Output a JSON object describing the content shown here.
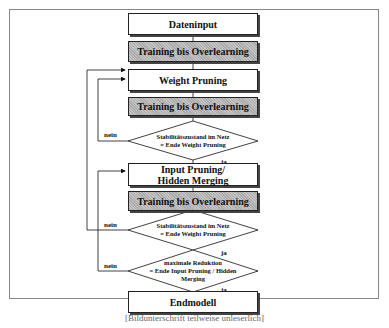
{
  "diagram": {
    "type": "flowchart",
    "language": "de",
    "nodes": [
      {
        "id": "dateninput",
        "label": "Dateninput",
        "shape": "rect",
        "shaded": false
      },
      {
        "id": "training1",
        "label": "Training bis Overlearning",
        "shape": "rect",
        "shaded": true
      },
      {
        "id": "weight_pruning",
        "label": "Weight Pruning",
        "shape": "rect",
        "shaded": false
      },
      {
        "id": "training2",
        "label": "Training bis Overlearning",
        "shape": "rect",
        "shaded": true
      },
      {
        "id": "decision1",
        "label_line1": "Stabilitätszustand im Netz",
        "label_line2": "= Ende Weight Pruning",
        "shape": "diamond"
      },
      {
        "id": "input_pruning",
        "label_line1": "Input Pruning/",
        "label_line2": "Hidden Merging",
        "shape": "rect",
        "shaded": false
      },
      {
        "id": "training3",
        "label": "Training bis Overlearning",
        "shape": "rect",
        "shaded": true
      },
      {
        "id": "decision2",
        "label_line1": "Stabilitätszustand im Netz",
        "label_line2": "= Ende Weight Pruning",
        "shape": "diamond"
      },
      {
        "id": "decision3",
        "label_line1": "maximale Reduktion",
        "label_line2": "= Ende Input Pruning / Hidden",
        "label_line3": "Merging",
        "shape": "diamond"
      },
      {
        "id": "endmodell",
        "label": "Endmodell",
        "shape": "rect",
        "shaded": false
      }
    ],
    "edges": [
      {
        "from": "dateninput",
        "to": "training1"
      },
      {
        "from": "training1",
        "to": "weight_pruning"
      },
      {
        "from": "weight_pruning",
        "to": "training2"
      },
      {
        "from": "training2",
        "to": "decision1"
      },
      {
        "from": "decision1",
        "to": "weight_pruning",
        "label": "nein"
      },
      {
        "from": "decision1",
        "to": "input_pruning",
        "label": "ja"
      },
      {
        "from": "input_pruning",
        "to": "training3"
      },
      {
        "from": "training3",
        "to": "decision2"
      },
      {
        "from": "decision2",
        "to": "weight_pruning",
        "label": "nein"
      },
      {
        "from": "decision2",
        "to": "decision3",
        "label": "ja"
      },
      {
        "from": "decision3",
        "to": "input_pruning",
        "label": "nein"
      },
      {
        "from": "decision3",
        "to": "endmodell",
        "label": "ja"
      }
    ],
    "edge_labels": {
      "no": "nein",
      "yes": "ja"
    },
    "caption": "[Bildunterschrift teilweise unleserlich]"
  }
}
